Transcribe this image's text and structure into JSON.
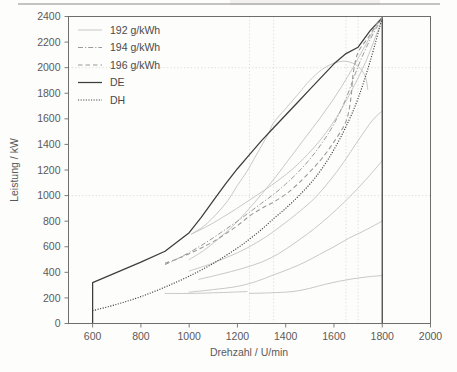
{
  "chart_data": {
    "type": "line",
    "title": "",
    "xlabel": "Drehzahl / U/min",
    "ylabel": "Leistung / kW",
    "xlim": [
      500,
      2000
    ],
    "ylim": [
      0,
      2400
    ],
    "xticks": [
      600,
      800,
      1000,
      1200,
      1400,
      1600,
      1800,
      2000
    ],
    "yticks": [
      0,
      200,
      400,
      600,
      800,
      1000,
      1200,
      1400,
      1600,
      1800,
      2000,
      2200,
      2400
    ],
    "grid": "dotted gridlines at y=1000 and y=2000, plus vertical dotted lines near x=1250, x=1350, x=1650 and x=1700",
    "legend_position": "top-left inside axes",
    "legend": [
      {
        "label": "192 g/kWh",
        "style": "solid-light",
        "color": "#c2c2c2"
      },
      {
        "label": "194 g/kWh",
        "style": "dash-dot",
        "color": "#9a9a9a"
      },
      {
        "label": "196 g/kWh",
        "style": "dashed",
        "color": "#9a9a9a"
      },
      {
        "label": "DE",
        "style": "solid",
        "color": "#3d3d3d"
      },
      {
        "label": "DH",
        "style": "dotted",
        "color": "#3d3d3d"
      }
    ],
    "series": [
      {
        "name": "DE",
        "style": "solid",
        "color": "#3d3d3d",
        "points": [
          [
            600,
            0
          ],
          [
            600,
            320
          ],
          [
            700,
            400
          ],
          [
            800,
            480
          ],
          [
            900,
            565
          ],
          [
            1000,
            710
          ],
          [
            1050,
            830
          ],
          [
            1100,
            960
          ],
          [
            1150,
            1090
          ],
          [
            1200,
            1210
          ],
          [
            1250,
            1320
          ],
          [
            1300,
            1430
          ],
          [
            1350,
            1530
          ],
          [
            1400,
            1630
          ],
          [
            1450,
            1730
          ],
          [
            1500,
            1830
          ],
          [
            1550,
            1930
          ],
          [
            1600,
            2030
          ],
          [
            1650,
            2110
          ],
          [
            1700,
            2160
          ],
          [
            1750,
            2290
          ],
          [
            1800,
            2390
          ],
          [
            1800,
            0
          ]
        ]
      },
      {
        "name": "DH",
        "style": "dotted",
        "color": "#3d3d3d",
        "points": [
          [
            600,
            100
          ],
          [
            700,
            150
          ],
          [
            800,
            210
          ],
          [
            900,
            285
          ],
          [
            1000,
            370
          ],
          [
            1100,
            470
          ],
          [
            1200,
            590
          ],
          [
            1250,
            660
          ],
          [
            1300,
            735
          ],
          [
            1350,
            820
          ],
          [
            1400,
            900
          ],
          [
            1450,
            990
          ],
          [
            1500,
            1090
          ],
          [
            1550,
            1210
          ],
          [
            1600,
            1360
          ],
          [
            1650,
            1540
          ],
          [
            1700,
            1760
          ],
          [
            1750,
            2050
          ],
          [
            1800,
            2390
          ]
        ]
      },
      {
        "name": "194 g/kWh",
        "style": "dash-dot",
        "color": "#9a9a9a",
        "points": [
          [
            900,
            460
          ],
          [
            950,
            505
          ],
          [
            1000,
            555
          ],
          [
            1050,
            610
          ],
          [
            1100,
            670
          ],
          [
            1150,
            735
          ],
          [
            1200,
            800
          ],
          [
            1250,
            870
          ],
          [
            1300,
            940
          ],
          [
            1350,
            1010
          ],
          [
            1400,
            1090
          ],
          [
            1450,
            1180
          ],
          [
            1500,
            1285
          ],
          [
            1550,
            1410
          ],
          [
            1600,
            1560
          ],
          [
            1650,
            1760
          ],
          [
            1700,
            2010
          ],
          [
            1750,
            2220
          ],
          [
            1800,
            2390
          ]
        ]
      },
      {
        "name": "196 g/kWh",
        "style": "dashed",
        "color": "#9a9a9a",
        "points": [
          [
            900,
            470
          ],
          [
            950,
            505
          ],
          [
            1000,
            545
          ],
          [
            1050,
            590
          ],
          [
            1100,
            640
          ],
          [
            1150,
            700
          ],
          [
            1200,
            765
          ],
          [
            1250,
            840
          ],
          [
            1300,
            900
          ],
          [
            1350,
            950
          ],
          [
            1400,
            1010
          ],
          [
            1450,
            1090
          ],
          [
            1500,
            1185
          ],
          [
            1550,
            1290
          ],
          [
            1600,
            1420
          ],
          [
            1650,
            1580
          ],
          [
            1670,
            1760
          ],
          [
            1680,
            1960
          ],
          [
            1700,
            2120
          ],
          [
            1740,
            2230
          ],
          [
            1780,
            2350
          ],
          [
            1800,
            2390
          ]
        ]
      },
      {
        "name": "192 g/kWh island",
        "style": "solid-light",
        "color": "#c2c2c2",
        "points": [
          [
            1010,
            700
          ],
          [
            1060,
            760
          ],
          [
            1110,
            850
          ],
          [
            1160,
            960
          ],
          [
            1200,
            1080
          ],
          [
            1240,
            1190
          ],
          [
            1270,
            1290
          ],
          [
            1300,
            1390
          ],
          [
            1330,
            1490
          ],
          [
            1350,
            1570
          ],
          [
            1400,
            1680
          ],
          [
            1450,
            1790
          ],
          [
            1500,
            1900
          ],
          [
            1550,
            1985
          ],
          [
            1600,
            2035
          ],
          [
            1650,
            2050
          ],
          [
            1700,
            2010
          ],
          [
            1730,
            1930
          ],
          [
            1740,
            1830
          ]
        ]
      },
      {
        "name": "contour-1",
        "style": "solid-light",
        "color": "#c2c2c2",
        "points": [
          [
            1000,
            500
          ],
          [
            1060,
            570
          ],
          [
            1120,
            660
          ],
          [
            1180,
            760
          ],
          [
            1240,
            880
          ],
          [
            1300,
            1010
          ],
          [
            1360,
            1150
          ],
          [
            1420,
            1300
          ],
          [
            1480,
            1450
          ],
          [
            1540,
            1600
          ],
          [
            1600,
            1760
          ],
          [
            1660,
            1940
          ],
          [
            1720,
            2140
          ],
          [
            1770,
            2310
          ],
          [
            1800,
            2390
          ]
        ]
      },
      {
        "name": "contour-2",
        "style": "solid-light",
        "color": "#c2c2c2",
        "points": [
          [
            1010,
            700
          ],
          [
            1070,
            755
          ],
          [
            1130,
            820
          ],
          [
            1190,
            890
          ],
          [
            1250,
            965
          ],
          [
            1310,
            1040
          ],
          [
            1370,
            1120
          ],
          [
            1430,
            1210
          ],
          [
            1490,
            1320
          ],
          [
            1550,
            1450
          ],
          [
            1610,
            1610
          ],
          [
            1670,
            1810
          ],
          [
            1730,
            2040
          ],
          [
            1780,
            2280
          ],
          [
            1800,
            2390
          ]
        ]
      },
      {
        "name": "contour-3",
        "style": "solid-light",
        "color": "#c2c2c2",
        "points": [
          [
            1000,
            410
          ],
          [
            1080,
            460
          ],
          [
            1160,
            520
          ],
          [
            1240,
            590
          ],
          [
            1320,
            680
          ],
          [
            1400,
            790
          ],
          [
            1460,
            880
          ],
          [
            1520,
            980
          ],
          [
            1580,
            1110
          ],
          [
            1640,
            1260
          ],
          [
            1700,
            1430
          ],
          [
            1760,
            1590
          ],
          [
            1800,
            1660
          ]
        ]
      },
      {
        "name": "contour-4",
        "style": "solid-light",
        "color": "#c2c2c2",
        "points": [
          [
            1040,
            345
          ],
          [
            1130,
            385
          ],
          [
            1220,
            430
          ],
          [
            1300,
            480
          ],
          [
            1370,
            545
          ],
          [
            1430,
            620
          ],
          [
            1490,
            700
          ],
          [
            1550,
            790
          ],
          [
            1610,
            890
          ],
          [
            1670,
            1000
          ],
          [
            1730,
            1120
          ],
          [
            1790,
            1250
          ],
          [
            1800,
            1280
          ]
        ]
      },
      {
        "name": "contour-5",
        "style": "solid-light",
        "color": "#c2c2c2",
        "points": [
          [
            1000,
            245
          ],
          [
            1100,
            265
          ],
          [
            1200,
            290
          ],
          [
            1280,
            330
          ],
          [
            1350,
            380
          ],
          [
            1420,
            430
          ],
          [
            1480,
            480
          ],
          [
            1540,
            540
          ],
          [
            1600,
            600
          ],
          [
            1660,
            665
          ],
          [
            1720,
            720
          ],
          [
            1780,
            780
          ],
          [
            1800,
            800
          ]
        ]
      },
      {
        "name": "contour-6",
        "style": "solid-light",
        "color": "#c2c2c2",
        "points": [
          [
            1250,
            235
          ],
          [
            1340,
            240
          ],
          [
            1430,
            250
          ],
          [
            1500,
            275
          ],
          [
            1560,
            305
          ],
          [
            1620,
            330
          ],
          [
            1680,
            350
          ],
          [
            1740,
            365
          ],
          [
            1800,
            375
          ]
        ]
      },
      {
        "name": "contour-7",
        "style": "solid-light",
        "color": "#c2c2c2",
        "points": [
          [
            900,
            235
          ],
          [
            1000,
            235
          ],
          [
            1100,
            240
          ],
          [
            1180,
            245
          ],
          [
            1240,
            250
          ]
        ]
      }
    ]
  },
  "axes": {
    "x_title": "Drehzahl / U/min",
    "y_title": "Leistung / kW"
  }
}
